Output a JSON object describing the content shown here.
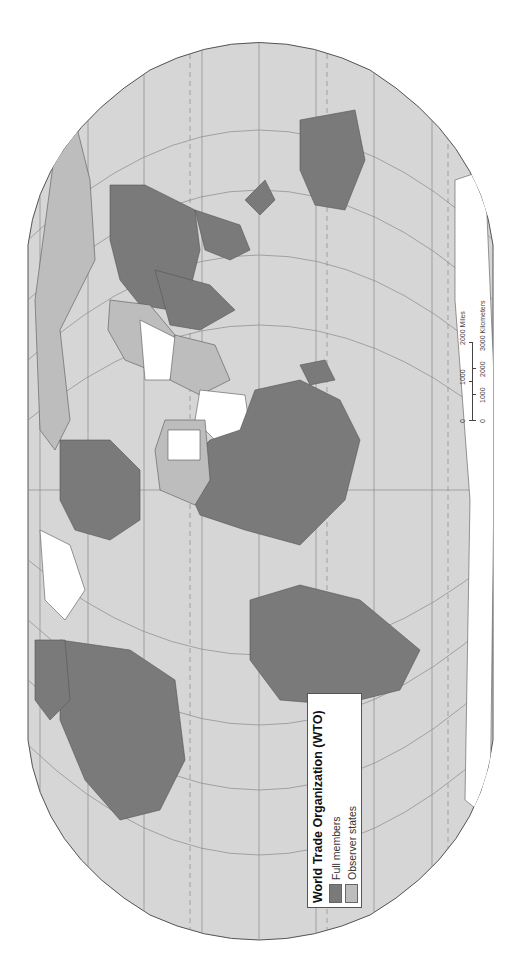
{
  "map": {
    "title": "World Trade Organization (WTO)",
    "projection": "rotated world map (rotated 90° counter-clockwise)",
    "colors": {
      "ocean": "#d6d6d6",
      "full_member": "#7a7a7a",
      "observer": "#bdbdbd",
      "non_member": "#ffffff",
      "graticule": "#8a8a8a",
      "border": "#555555"
    }
  },
  "legend": {
    "title": "World Trade Organization (WTO)",
    "items": [
      {
        "label": "Full members",
        "color": "#7a7a7a"
      },
      {
        "label": "Observer states",
        "color": "#bdbdbd"
      }
    ]
  },
  "scale_bar": {
    "miles_label": "2000 Miles",
    "miles_ticks": [
      "0",
      "1000",
      "2000"
    ],
    "km_label": "3000 Kilometers",
    "km_ticks": [
      "0",
      "1000",
      "2000",
      "3000"
    ]
  }
}
